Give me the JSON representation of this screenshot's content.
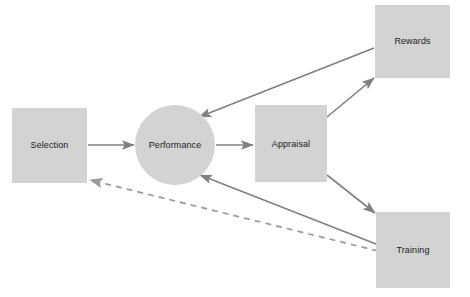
{
  "diagram": {
    "type": "flow-diagram",
    "background_color": "#ffffff",
    "shape_fill_color": "#d3d3d3",
    "line_color": "#808080",
    "label_color": "#1a1a1a",
    "nodes": [
      {
        "id": "selection",
        "label": "Selection",
        "shape": "rectangle",
        "x": 12,
        "y": 108,
        "width": 75,
        "height": 75,
        "cx": 49.5,
        "cy": 145.5
      },
      {
        "id": "performance",
        "label": "Performance",
        "shape": "circle",
        "cx": 175,
        "cy": 145,
        "radius": 40
      },
      {
        "id": "appraisal",
        "label": "Appraisal",
        "shape": "rectangle",
        "x": 255,
        "y": 105,
        "width": 72,
        "height": 77,
        "cx": 291,
        "cy": 143.5
      },
      {
        "id": "rewards",
        "label": "Rewards",
        "shape": "rectangle",
        "x": 375,
        "y": 5,
        "width": 75,
        "height": 73,
        "cx": 412.5,
        "cy": 41.5
      },
      {
        "id": "training",
        "label": "Training",
        "shape": "rectangle",
        "x": 376,
        "y": 212,
        "width": 74,
        "height": 76,
        "cx": 413,
        "cy": 250
      }
    ],
    "edges": [
      {
        "id": "selection-to-performance",
        "from": "selection",
        "to": "performance",
        "style": "solid",
        "arrow": "end",
        "x1": 88,
        "y1": 145,
        "x2": 134,
        "y2": 145
      },
      {
        "id": "performance-to-appraisal",
        "from": "performance",
        "to": "appraisal",
        "style": "solid",
        "arrow": "end",
        "x1": 216,
        "y1": 145,
        "x2": 253,
        "y2": 145
      },
      {
        "id": "appraisal-to-rewards",
        "from": "appraisal",
        "to": "rewards",
        "style": "solid",
        "arrow": "end",
        "x1": 327,
        "y1": 117,
        "x2": 374,
        "y2": 78
      },
      {
        "id": "appraisal-to-training",
        "from": "appraisal",
        "to": "training",
        "style": "solid",
        "arrow": "end",
        "x1": 327,
        "y1": 175,
        "x2": 375,
        "y2": 213
      },
      {
        "id": "rewards-to-performance",
        "from": "rewards",
        "to": "performance",
        "style": "solid",
        "arrow": "end",
        "x1": 374,
        "y1": 48,
        "x2": 198,
        "y2": 117
      },
      {
        "id": "training-to-performance",
        "from": "training",
        "to": "performance",
        "style": "solid",
        "arrow": "end",
        "x1": 376,
        "y1": 244,
        "x2": 199,
        "y2": 175
      },
      {
        "id": "training-to-selection",
        "from": "training",
        "to": "selection",
        "style": "dashed",
        "arrow": "end",
        "x1": 378,
        "y1": 251,
        "x2": 89,
        "y2": 180
      }
    ]
  }
}
